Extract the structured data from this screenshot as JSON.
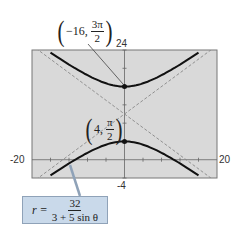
{
  "chart_data": {
    "type": "line",
    "title": "",
    "xlabel": "",
    "ylabel": "",
    "xlim": [
      -20,
      20
    ],
    "ylim": [
      -4,
      24
    ],
    "tick_labels": {
      "x_min": "-20",
      "x_max": "20",
      "y_min": "-4",
      "y_max": "24"
    },
    "curve": {
      "name": "hyperbola",
      "equation_lhs": "r =",
      "equation_num": "32",
      "equation_den": "3 + 5 sin θ",
      "center": [
        0,
        10
      ],
      "a": 6,
      "b": 8,
      "vertices": [
        [
          0,
          16
        ],
        [
          0,
          4
        ]
      ]
    },
    "asymptotes": [
      {
        "slope": 0.75,
        "through": [
          0,
          10
        ],
        "style": "dashed"
      },
      {
        "slope": -0.75,
        "through": [
          0,
          10
        ],
        "style": "dashed"
      }
    ],
    "annotations": [
      {
        "point": [
          0,
          16
        ],
        "label_r": "−16,",
        "label_num": "3π",
        "label_den": "2"
      },
      {
        "point": [
          0,
          4
        ],
        "label_r": "4,",
        "label_num": "π",
        "label_den": "2"
      }
    ],
    "grid": false,
    "background": "#d9d9d9"
  }
}
